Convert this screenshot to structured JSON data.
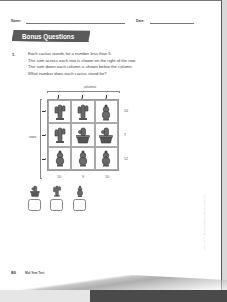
{
  "header": {
    "name_label": "Name:",
    "date_label": "Date:"
  },
  "section": {
    "title": "Bonus Questions"
  },
  "question": {
    "number": "1.",
    "lines": [
      "Each cactus stands for a number less than 5.",
      "The sum across each row is shown on the right of the row.",
      "The sum down each column is shown below the column.",
      "What number does each cactus stand for?"
    ]
  },
  "grid": {
    "columns_label": "columns",
    "rows_label": "rows",
    "cells": [
      [
        "tall-cactus",
        "tall-cactus",
        "round-cactus"
      ],
      [
        "tall-cactus",
        "potted-cactus",
        "potted-cactus"
      ],
      [
        "round-cactus",
        "round-cactus",
        "round-cactus"
      ]
    ],
    "row_sums": [
      "10",
      "7",
      "12"
    ],
    "column_sums": [
      "10",
      "9",
      "10"
    ]
  },
  "answer_key": {
    "items": [
      {
        "icon": "potted-cactus",
        "value": ""
      },
      {
        "icon": "tall-cactus",
        "value": ""
      },
      {
        "icon": "round-cactus",
        "value": ""
      }
    ]
  },
  "footer": {
    "page_number": "80",
    "book_title": "Mid-Year Test"
  },
  "side_note": "Copyright © Marshall Cavendish Education Pte Ltd"
}
